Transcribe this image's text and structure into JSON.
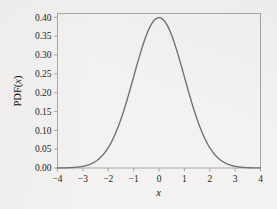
{
  "figure": {
    "background_color": "#f3f2f0",
    "frame_color": "#a8a8a8",
    "curve_color": "#6f6f6f",
    "text_color": "#1d1d1d"
  },
  "chart_data": {
    "type": "line",
    "title": "",
    "subtitle": "",
    "xlabel": "x",
    "ylabel": "PDF(x)",
    "ylabel_parts": {
      "prefix": "PDF(",
      "variable": "x",
      "suffix": ")"
    },
    "xlim": [
      -4,
      4
    ],
    "ylim": [
      0.0,
      0.41
    ],
    "grid": false,
    "legend": null,
    "legend_position": "none",
    "xticks": [
      -4,
      -3,
      -2,
      -1,
      0,
      1,
      2,
      3,
      4
    ],
    "xticklabels": [
      "−4",
      "−3",
      "−2",
      "−1",
      "0",
      "1",
      "2",
      "3",
      "4"
    ],
    "yticks": [
      0.0,
      0.05,
      0.1,
      0.15,
      0.2,
      0.25,
      0.3,
      0.35,
      0.4
    ],
    "yticklabels": [
      "0.00",
      "0.05",
      "0.10",
      "0.15",
      "0.20",
      "0.25",
      "0.30",
      "0.35",
      "0.40"
    ],
    "series": [
      {
        "name": "Standard normal PDF",
        "color": "#6f6f6f",
        "x": [
          -4.0,
          -3.8,
          -3.6,
          -3.4,
          -3.2,
          -3.0,
          -2.8,
          -2.6,
          -2.4,
          -2.2,
          -2.0,
          -1.8,
          -1.6,
          -1.4,
          -1.2,
          -1.0,
          -0.8,
          -0.6,
          -0.4,
          -0.2,
          0.0,
          0.2,
          0.4,
          0.6,
          0.8,
          1.0,
          1.2,
          1.4,
          1.6,
          1.8,
          2.0,
          2.2,
          2.4,
          2.6,
          2.8,
          3.0,
          3.2,
          3.4,
          3.6,
          3.8,
          4.0
        ],
        "y": [
          0.0001,
          0.0003,
          0.0006,
          0.0012,
          0.0024,
          0.0044,
          0.0079,
          0.0136,
          0.0224,
          0.0355,
          0.054,
          0.079,
          0.1109,
          0.1497,
          0.1942,
          0.242,
          0.2897,
          0.3332,
          0.3683,
          0.391,
          0.3989,
          0.391,
          0.3683,
          0.3332,
          0.2897,
          0.242,
          0.1942,
          0.1497,
          0.1109,
          0.079,
          0.054,
          0.0355,
          0.0224,
          0.0136,
          0.0079,
          0.0044,
          0.0024,
          0.0012,
          0.0006,
          0.0003,
          0.0001
        ]
      }
    ]
  }
}
